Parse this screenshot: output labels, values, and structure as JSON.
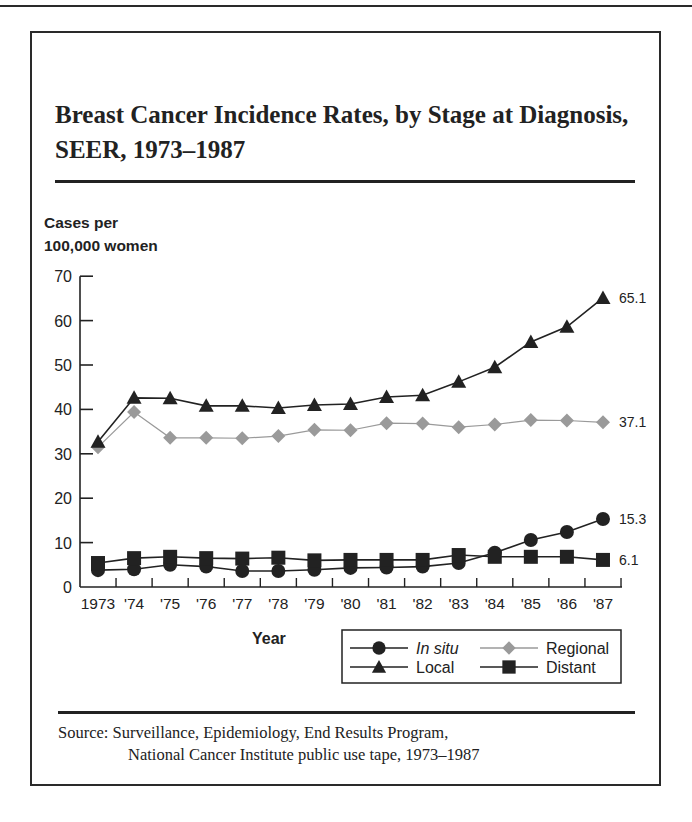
{
  "header": {
    "title": "Breast Cancer Incidence Rates, by Stage at Diagnosis, SEER, 1973–1987"
  },
  "axes": {
    "ylabel_line1": "Cases per",
    "ylabel_line2": "100,000 women",
    "xlabel": "Year"
  },
  "footer": {
    "source_line1": "Source: Surveillance, Epidemiology, End Results Program,",
    "source_line2": "National Cancer Institute public use tape, 1973–1987"
  },
  "legend": {
    "items": [
      {
        "name": "In situ",
        "marker": "circle",
        "color": "#222222",
        "italic": true
      },
      {
        "name": "Regional",
        "marker": "diamond",
        "color": "#9a9a9a",
        "italic": false
      },
      {
        "name": "Local",
        "marker": "triangle",
        "color": "#222222",
        "italic": false
      },
      {
        "name": "Distant",
        "marker": "square",
        "color": "#222222",
        "italic": false
      }
    ]
  },
  "chart_data": {
    "type": "line",
    "title": "Breast Cancer Incidence Rates, by Stage at Diagnosis, SEER, 1973–1987",
    "xlabel": "Year",
    "ylabel": "Cases per 100,000 women",
    "ylim": [
      0,
      70
    ],
    "yticks": [
      0,
      10,
      20,
      30,
      40,
      50,
      60,
      70
    ],
    "grid": false,
    "legend_position": "lower right",
    "categories": [
      "1973",
      "'74",
      "'75",
      "'76",
      "'77",
      "'78",
      "'79",
      "'80",
      "'81",
      "'82",
      "'83",
      "'84",
      "'85",
      "'86",
      "'87"
    ],
    "series": [
      {
        "name": "Local",
        "marker": "triangle",
        "color": "#222222",
        "values": [
          32.7,
          42.6,
          42.5,
          40.8,
          40.8,
          40.3,
          41.0,
          41.2,
          42.8,
          43.2,
          46.2,
          49.5,
          55.2,
          58.6,
          65.1
        ],
        "end_label": "65.1"
      },
      {
        "name": "Regional",
        "marker": "diamond",
        "color": "#9a9a9a",
        "values": [
          31.5,
          39.4,
          33.6,
          33.6,
          33.5,
          34.0,
          35.4,
          35.3,
          36.9,
          36.8,
          36.0,
          36.6,
          37.6,
          37.5,
          37.1
        ],
        "end_label": "37.1"
      },
      {
        "name": "In situ",
        "marker": "circle",
        "color": "#222222",
        "values": [
          3.8,
          4.0,
          5.0,
          4.6,
          3.6,
          3.6,
          3.9,
          4.3,
          4.4,
          4.6,
          5.4,
          7.7,
          10.6,
          12.4,
          15.3
        ],
        "end_label": "15.3"
      },
      {
        "name": "Distant",
        "marker": "square",
        "color": "#222222",
        "values": [
          5.4,
          6.5,
          6.8,
          6.5,
          6.4,
          6.6,
          6.0,
          6.1,
          6.1,
          6.1,
          7.2,
          6.8,
          6.8,
          6.8,
          6.1
        ],
        "end_label": "6.1"
      }
    ]
  }
}
